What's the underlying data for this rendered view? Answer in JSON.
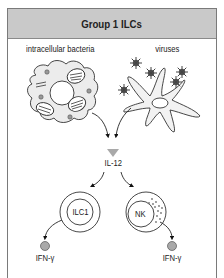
{
  "header": {
    "title": "Group 1 ILCs"
  },
  "triggers": [
    {
      "label": "intracellular bacteria",
      "depiction": "infected-macrophage"
    },
    {
      "label": "viruses",
      "depiction": "dendritic-cell-with-virions"
    }
  ],
  "cytokine": {
    "label": "IL-12",
    "color": "#a9a9a9"
  },
  "cells": [
    {
      "label": "ILC1",
      "product": "IFN-γ"
    },
    {
      "label": "NK",
      "product": "IFN-γ"
    }
  ],
  "colors": {
    "header_bg": "#c9c9c9",
    "border": "#7a7a7a",
    "cell_fill": "#ececec",
    "stroke": "#333333",
    "product_fill": "#a9a9a9"
  }
}
